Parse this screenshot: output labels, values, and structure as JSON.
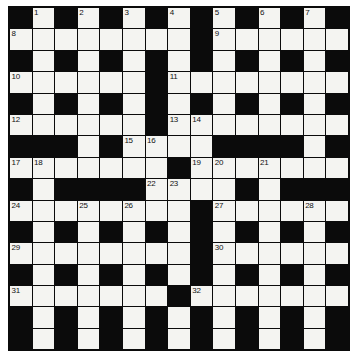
{
  "puzzle": {
    "title": "Crossword Grid",
    "type": "crossword",
    "columns": 15,
    "rows": 16,
    "colors": {
      "block": "#0b0b0b",
      "cell": "#f4f4f1",
      "number": "#111111",
      "page": "#ffffff"
    },
    "legend": {
      "white_code": 1,
      "black_code": 0
    },
    "grid": [
      [
        0,
        1,
        0,
        1,
        0,
        1,
        0,
        1,
        0,
        1,
        0,
        1,
        0,
        1,
        0
      ],
      [
        1,
        1,
        1,
        1,
        1,
        1,
        1,
        1,
        0,
        1,
        1,
        1,
        1,
        1,
        1
      ],
      [
        0,
        1,
        0,
        1,
        0,
        1,
        0,
        1,
        0,
        1,
        0,
        1,
        0,
        1,
        0
      ],
      [
        1,
        1,
        1,
        1,
        1,
        1,
        0,
        1,
        1,
        1,
        1,
        1,
        1,
        1,
        1
      ],
      [
        0,
        1,
        0,
        1,
        0,
        1,
        0,
        1,
        0,
        1,
        0,
        1,
        0,
        1,
        0
      ],
      [
        1,
        1,
        1,
        1,
        1,
        1,
        0,
        1,
        1,
        1,
        1,
        1,
        1,
        1,
        1
      ],
      [
        0,
        0,
        0,
        1,
        0,
        1,
        1,
        1,
        1,
        0,
        0,
        0,
        0,
        1,
        0
      ],
      [
        1,
        1,
        1,
        1,
        1,
        1,
        1,
        0,
        1,
        1,
        1,
        1,
        1,
        1,
        1
      ],
      [
        0,
        1,
        0,
        0,
        0,
        0,
        1,
        1,
        1,
        1,
        0,
        1,
        0,
        0,
        0
      ],
      [
        1,
        1,
        1,
        1,
        1,
        1,
        1,
        1,
        0,
        1,
        1,
        1,
        1,
        1,
        1
      ],
      [
        0,
        1,
        0,
        1,
        0,
        1,
        0,
        1,
        0,
        1,
        0,
        1,
        0,
        1,
        0
      ],
      [
        1,
        1,
        1,
        1,
        1,
        1,
        1,
        1,
        0,
        1,
        1,
        1,
        1,
        1,
        1
      ],
      [
        0,
        1,
        0,
        1,
        0,
        1,
        0,
        1,
        0,
        1,
        0,
        1,
        0,
        1,
        0
      ],
      [
        1,
        1,
        1,
        1,
        1,
        1,
        1,
        0,
        1,
        1,
        1,
        1,
        1,
        1,
        1
      ],
      [
        0,
        1,
        0,
        1,
        0,
        1,
        0,
        1,
        0,
        1,
        0,
        1,
        0,
        1,
        0
      ],
      [
        0,
        1,
        0,
        1,
        0,
        1,
        0,
        1,
        0,
        1,
        0,
        1,
        0,
        1,
        0
      ]
    ],
    "numbers": [
      {
        "row": 0,
        "col": 1,
        "label": "1"
      },
      {
        "row": 0,
        "col": 3,
        "label": "2"
      },
      {
        "row": 0,
        "col": 5,
        "label": "3"
      },
      {
        "row": 0,
        "col": 7,
        "label": "4"
      },
      {
        "row": 0,
        "col": 9,
        "label": "5"
      },
      {
        "row": 0,
        "col": 11,
        "label": "6"
      },
      {
        "row": 0,
        "col": 13,
        "label": "7"
      },
      {
        "row": 1,
        "col": 0,
        "label": "8"
      },
      {
        "row": 1,
        "col": 9,
        "label": "9"
      },
      {
        "row": 3,
        "col": 0,
        "label": "10"
      },
      {
        "row": 3,
        "col": 7,
        "label": "11"
      },
      {
        "row": 5,
        "col": 0,
        "label": "12"
      },
      {
        "row": 5,
        "col": 7,
        "label": "13"
      },
      {
        "row": 5,
        "col": 8,
        "label": "14"
      },
      {
        "row": 6,
        "col": 5,
        "label": "15"
      },
      {
        "row": 6,
        "col": 6,
        "label": "16"
      },
      {
        "row": 7,
        "col": 0,
        "label": "17"
      },
      {
        "row": 7,
        "col": 1,
        "label": "18"
      },
      {
        "row": 7,
        "col": 8,
        "label": "19"
      },
      {
        "row": 7,
        "col": 9,
        "label": "20"
      },
      {
        "row": 7,
        "col": 11,
        "label": "21"
      },
      {
        "row": 8,
        "col": 6,
        "label": "22"
      },
      {
        "row": 8,
        "col": 7,
        "label": "23"
      },
      {
        "row": 9,
        "col": 0,
        "label": "24"
      },
      {
        "row": 9,
        "col": 3,
        "label": "25"
      },
      {
        "row": 9,
        "col": 5,
        "label": "26"
      },
      {
        "row": 9,
        "col": 9,
        "label": "27"
      },
      {
        "row": 9,
        "col": 13,
        "label": "28"
      },
      {
        "row": 11,
        "col": 0,
        "label": "29"
      },
      {
        "row": 11,
        "col": 9,
        "label": "30"
      },
      {
        "row": 13,
        "col": 0,
        "label": "31"
      },
      {
        "row": 13,
        "col": 8,
        "label": "32"
      }
    ]
  }
}
